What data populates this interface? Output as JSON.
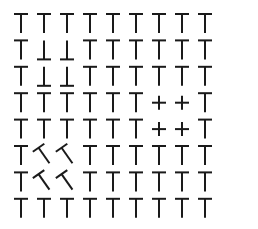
{
  "figure": {
    "rows": 8,
    "cols": 9,
    "ink_color": "#1a1a1a",
    "background": "#ffffff",
    "origin_x": 21,
    "origin_y": 14,
    "col_spacing": 23,
    "row_spacing": 26.4,
    "bar_half_width": 7,
    "stem_length": 19
  },
  "default_glyph": "T",
  "special_cells": [
    {
      "row": 1,
      "col": 1,
      "glyph": "inverted-T"
    },
    {
      "row": 1,
      "col": 2,
      "glyph": "inverted-T"
    },
    {
      "row": 2,
      "col": 1,
      "glyph": "inverted-T"
    },
    {
      "row": 2,
      "col": 2,
      "glyph": "inverted-T"
    },
    {
      "row": 3,
      "col": 6,
      "glyph": "plus"
    },
    {
      "row": 3,
      "col": 7,
      "glyph": "plus"
    },
    {
      "row": 4,
      "col": 6,
      "glyph": "plus"
    },
    {
      "row": 4,
      "col": 7,
      "glyph": "plus"
    },
    {
      "row": 5,
      "col": 1,
      "glyph": "rotated-T",
      "angle": -35
    },
    {
      "row": 5,
      "col": 2,
      "glyph": "rotated-T",
      "angle": -35
    },
    {
      "row": 6,
      "col": 1,
      "glyph": "rotated-T",
      "angle": -35
    },
    {
      "row": 6,
      "col": 2,
      "glyph": "rotated-T",
      "angle": -35
    }
  ]
}
